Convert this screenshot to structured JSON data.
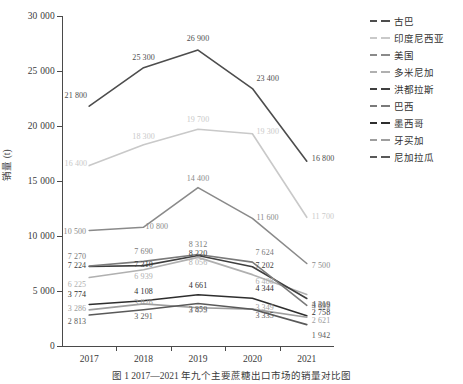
{
  "chart_data": {
    "type": "line",
    "title": "",
    "xlabel": "",
    "ylabel": "销量 (t)",
    "categories": [
      "2017",
      "2018",
      "2019",
      "2020",
      "2021"
    ],
    "ylim": [
      0,
      30000
    ],
    "ytick_labels": [
      "0",
      "5 000",
      "10 000",
      "15 000",
      "20 000",
      "25 000",
      "30 000"
    ],
    "ytick_values": [
      0,
      5000,
      10000,
      15000,
      20000,
      25000,
      30000
    ],
    "grid": false,
    "legend_position": "right",
    "series": [
      {
        "name": "古巴",
        "color": "#4d4d4d",
        "values": [
          21800,
          25300,
          26900,
          23400,
          16800
        ],
        "labels": [
          "21 800",
          "25 300",
          "26 900",
          "23 400",
          "16 800"
        ]
      },
      {
        "name": "印度尼西亚",
        "color": "#c9c9c9",
        "values": [
          16400,
          18300,
          19700,
          19300,
          11700
        ],
        "labels": [
          "16 400",
          "18 300",
          "19 700",
          "19 300",
          "11 700"
        ]
      },
      {
        "name": "美国",
        "color": "#8a8a8a",
        "values": [
          10500,
          10800,
          14400,
          11600,
          7500
        ],
        "labels": [
          "10 500",
          "10 800",
          "14 400",
          "11 600",
          "7 500"
        ]
      },
      {
        "name": "多米尼加",
        "color": "#b0b0b0",
        "values": [
          6225,
          6939,
          8056,
          6488,
          4692
        ],
        "labels": [
          "6 225",
          "6 939",
          "8 056",
          "6 488",
          "4 692"
        ]
      },
      {
        "name": "洪都拉斯",
        "color": "#3f3f3f",
        "values": [
          7224,
          7310,
          8220,
          7202,
          4319
        ],
        "labels": [
          "7 224",
          "7 310",
          "8 220",
          "7 202",
          "4 319"
        ]
      },
      {
        "name": "巴西",
        "color": "#7a7a7a",
        "values": [
          7270,
          7690,
          8312,
          7624,
          3696
        ],
        "labels": [
          "7 270",
          "7 690",
          "8 312",
          "7 624",
          "3 696"
        ]
      },
      {
        "name": "墨西哥",
        "color": "#2e2e2e",
        "values": [
          3774,
          4108,
          4661,
          4344,
          2758
        ],
        "labels": [
          "3 774",
          "4 108",
          "4 661",
          "4 344",
          "2 758"
        ]
      },
      {
        "name": "牙买加",
        "color": "#9e9e9e",
        "values": [
          3286,
          3826,
          3475,
          3349,
          2621
        ],
        "labels": [
          "3 286",
          "3 826",
          "3 475",
          "3 349",
          "2 621"
        ]
      },
      {
        "name": "尼加拉瓜",
        "color": "#595959",
        "values": [
          2813,
          3291,
          3859,
          3335,
          1942
        ],
        "labels": [
          "2 813",
          "3 291",
          "3 859",
          "3 335",
          "1 942"
        ]
      }
    ]
  },
  "caption": "图 1  2017—2021 年九个主要蔗糖出口市场的销量对比图"
}
